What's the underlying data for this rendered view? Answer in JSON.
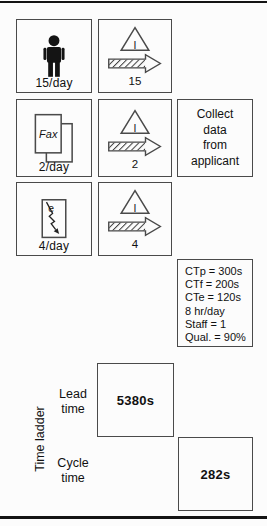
{
  "palette": {
    "line": "#4a4a4a",
    "rule": "#141414",
    "text": "#111111",
    "icon_fill": "#141414",
    "background": "#fcfcfc"
  },
  "sources": {
    "person": {
      "label": "15/day",
      "icon": "person-icon"
    },
    "fax": {
      "label": "2/day",
      "doc_text": "Fax",
      "icon": "fax-document-icon"
    },
    "email": {
      "label": "4/day",
      "doc_text": "e",
      "icon": "electronic-document-icon"
    }
  },
  "inventory": {
    "triangle_letter": "I",
    "triangle_icon": "inventory-triangle-icon",
    "arrow_icon": "hatched-push-arrow-icon",
    "items": [
      {
        "count": "15"
      },
      {
        "count": "2"
      },
      {
        "count": "4"
      }
    ]
  },
  "process": {
    "name_lines": [
      "Collect",
      "data",
      "from",
      "applicant"
    ]
  },
  "data_box": {
    "lines": [
      "CTp = 300s",
      "CTf = 200s",
      "CTe = 120s",
      "8 hr/day",
      "Staff = 1",
      "Qual. = 90%"
    ]
  },
  "time_ladder": {
    "axis_label": "Time ladder",
    "lead_label": "Lead time",
    "lead_value": "5380s",
    "cycle_label": "Cycle time",
    "cycle_value": "282s"
  }
}
